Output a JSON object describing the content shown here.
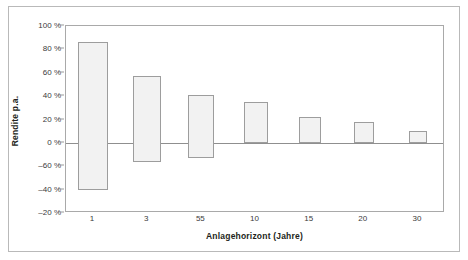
{
  "chart_data": {
    "type": "bar",
    "bar_style": "floating-range",
    "title": "",
    "subtitle": "",
    "xlabel": "Anlagehorizont (Jahre)",
    "ylabel": "Rendite p.a.",
    "categories": [
      "1",
      "3",
      "55",
      "10",
      "15",
      "20",
      "30"
    ],
    "series": [
      {
        "name": "Maximale Rendite p.a.",
        "values": [
          86,
          57,
          41,
          35,
          22,
          18,
          10
        ]
      },
      {
        "name": "Minimale Rendite p.a.",
        "values": [
          -40,
          -16,
          -13,
          0,
          0,
          0,
          0
        ]
      }
    ],
    "y_tick_labels": [
      "100 %",
      "80 %",
      "60 %",
      "40 %",
      "20 %",
      "0 %",
      "-60 %",
      "-40 %",
      "-20 %"
    ],
    "y_tick_values": [
      100,
      80,
      60,
      40,
      20,
      0,
      -20,
      -40,
      -60
    ],
    "ylim": [
      -60,
      100
    ],
    "y_unit": "%",
    "grid": false,
    "legend": "none",
    "colors": {
      "bar_fill": "#f2f2f2",
      "bar_border": "#9d9d9d",
      "axis": "#a9a9a9",
      "zero_line": "#8f8f8f",
      "text": "#231f20",
      "frame": "#b9b9b9"
    }
  }
}
